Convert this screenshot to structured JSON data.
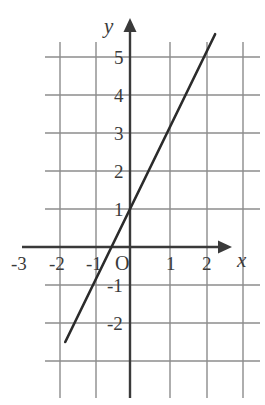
{
  "figure": {
    "name": "cartesian-line-graph",
    "background_color": "#ffffff",
    "grid_color": "#8c8c8c",
    "axis_color": "#3a3a3a",
    "line_color": "#2b2b2b"
  },
  "axes": {
    "x_axis_name": "x",
    "y_axis_name": "y",
    "origin_label": "O",
    "x_tick_labels": [
      "-3",
      "-2",
      "-1",
      "1",
      "2"
    ],
    "y_tick_labels": [
      "5",
      "4",
      "3",
      "2",
      "1",
      "-1",
      "-2"
    ]
  },
  "chart_data": {
    "type": "line",
    "title": "",
    "xlabel": "x",
    "ylabel": "y",
    "grid": true,
    "legend": "none",
    "xlim": [
      -3,
      3
    ],
    "ylim": [
      -3,
      6
    ],
    "xticks": [
      -3,
      -2,
      -1,
      0,
      1,
      2
    ],
    "yticks": [
      -2,
      -1,
      0,
      1,
      2,
      3,
      4,
      5
    ],
    "series": [
      {
        "name": "y = 2x + 1",
        "equation": "y = 2x + 1",
        "slope": 2,
        "y_intercept": 1,
        "x_intercept": -0.5,
        "x": [
          -1.75,
          2.3
        ],
        "y": [
          -2.5,
          5.6
        ],
        "points": [
          {
            "x": -1,
            "y": -1
          },
          {
            "x": -0.5,
            "y": 0
          },
          {
            "x": 0,
            "y": 1
          },
          {
            "x": 1,
            "y": 3
          },
          {
            "x": 2,
            "y": 5
          }
        ]
      }
    ]
  }
}
